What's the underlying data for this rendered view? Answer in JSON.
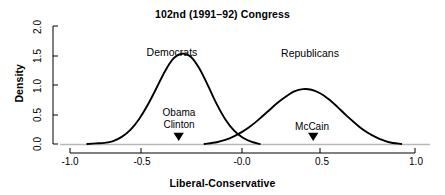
{
  "chart_data": {
    "type": "line",
    "title": "102nd (1991–92) Congress",
    "subtitle": "",
    "xlabel": "Liberal-Conservative",
    "ylabel": "Density",
    "xlim": [
      -1.0,
      1.0
    ],
    "ylim": [
      0.0,
      2.0
    ],
    "grid": false,
    "legend": "inline-labels",
    "xticks": [
      {
        "value": -1.0,
        "label": "-1.0"
      },
      {
        "value": -0.5,
        "label": "-0.5"
      },
      {
        "value": 0.0,
        "label": "-0.0"
      },
      {
        "value": 0.5,
        "label": "0.5"
      },
      {
        "value": 1.0,
        "label": "1.0"
      }
    ],
    "yticks": [
      {
        "value": 0.0,
        "label": "0.0"
      },
      {
        "value": 0.5,
        "label": "0.5"
      },
      {
        "value": 1.0,
        "label": "1.0"
      },
      {
        "value": 1.5,
        "label": "1.5"
      },
      {
        "value": 2.0,
        "label": "2.0"
      }
    ],
    "series": [
      {
        "name": "Democrats",
        "label_x": -0.4,
        "label_y": 1.82,
        "peak_x": -0.34,
        "peak_y": 1.53,
        "color": "#000000",
        "x": [
          -0.9,
          -0.85,
          -0.8,
          -0.75,
          -0.7,
          -0.65,
          -0.6,
          -0.55,
          -0.5,
          -0.45,
          -0.4,
          -0.35,
          -0.3,
          -0.25,
          -0.2,
          -0.15,
          -0.1,
          -0.05,
          0.0,
          0.05,
          0.1
        ],
        "values": [
          0.0,
          0.01,
          0.02,
          0.05,
          0.12,
          0.24,
          0.42,
          0.66,
          0.94,
          1.23,
          1.45,
          1.53,
          1.48,
          1.28,
          0.99,
          0.68,
          0.42,
          0.23,
          0.11,
          0.04,
          0.0
        ]
      },
      {
        "name": "Republicans",
        "label_x": 0.39,
        "label_y": 1.8,
        "peak_x": 0.38,
        "peak_y": 0.93,
        "color": "#000000",
        "x": [
          -0.22,
          -0.15,
          -0.1,
          -0.05,
          0.0,
          0.05,
          0.1,
          0.15,
          0.2,
          0.25,
          0.3,
          0.35,
          0.4,
          0.45,
          0.5,
          0.55,
          0.6,
          0.65,
          0.7,
          0.75,
          0.8,
          0.85,
          0.92
        ],
        "values": [
          0.0,
          0.03,
          0.07,
          0.13,
          0.21,
          0.31,
          0.43,
          0.56,
          0.69,
          0.8,
          0.89,
          0.93,
          0.92,
          0.86,
          0.76,
          0.63,
          0.49,
          0.36,
          0.24,
          0.15,
          0.08,
          0.03,
          0.0
        ]
      }
    ],
    "annotations": [
      {
        "id": "obama-clinton",
        "lines": [
          "Obama",
          "Clinton"
        ],
        "marker_x": -0.37,
        "marker_y": 0.05,
        "marker": "triangle-down"
      },
      {
        "id": "mccain",
        "lines": [
          "McCain"
        ],
        "marker_x": 0.41,
        "marker_y": 0.05,
        "marker": "triangle-down"
      }
    ],
    "axis_color": "#000000",
    "curve_color": "#000000",
    "background": "#ffffff"
  }
}
